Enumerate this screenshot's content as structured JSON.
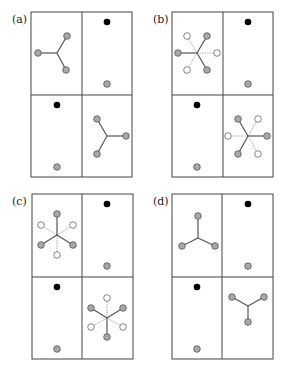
{
  "figure": {
    "panels": [
      {
        "id": "a",
        "label": "(a)",
        "box": {
          "x": 31,
          "y": 12,
          "w": 101,
          "h": 165
        },
        "cells": {
          "top_left": {
            "type": "star3",
            "center": [
              57,
              53
            ],
            "gray": [
              [
                38,
                53
              ],
              [
                67,
                36
              ],
              [
                66,
                70
              ]
            ],
            "white": []
          },
          "top_right": {
            "type": "pair",
            "black": [
              107,
              22
            ],
            "gray": [
              107,
              84
            ]
          },
          "bottom_left": {
            "type": "pair",
            "black": [
              57,
              105
            ],
            "gray": [
              57,
              167
            ]
          },
          "bottom_right": {
            "type": "star3",
            "center": [
              107,
              136
            ],
            "gray": [
              [
                97,
                119
              ],
              [
                126,
                136
              ],
              [
                97,
                154
              ]
            ],
            "white": []
          }
        }
      },
      {
        "id": "b",
        "label": "(b)",
        "box": {
          "x": 172,
          "y": 12,
          "w": 101,
          "h": 165
        },
        "cells": {
          "top_left": {
            "type": "star6",
            "center": [
              197,
              53
            ],
            "gray": [
              [
                178,
                53
              ],
              [
                207,
                36
              ],
              [
                207,
                70
              ]
            ],
            "white": [
              [
                187,
                36
              ],
              [
                217,
                53
              ],
              [
                187,
                70
              ]
            ]
          },
          "top_right": {
            "type": "pair",
            "black": [
              248,
              22
            ],
            "gray": [
              248,
              84
            ]
          },
          "bottom_left": {
            "type": "pair",
            "black": [
              197,
              105
            ],
            "gray": [
              197,
              167
            ]
          },
          "bottom_right": {
            "type": "star6",
            "center": [
              248,
              136
            ],
            "gray": [
              [
                238,
                119
              ],
              [
                267,
                136
              ],
              [
                238,
                154
              ]
            ],
            "white": [
              [
                258,
                119
              ],
              [
                228,
                136
              ],
              [
                258,
                154
              ]
            ]
          }
        }
      },
      {
        "id": "c",
        "label": "(c)",
        "box": {
          "x": 32,
          "y": 194,
          "w": 101,
          "h": 165
        },
        "cells": {
          "top_left": {
            "type": "star6",
            "center": [
              57,
              235
            ],
            "gray": [
              [
                57,
                214
              ],
              [
                41,
                245
              ],
              [
                73,
                245
              ]
            ],
            "white": [
              [
                41,
                225
              ],
              [
                73,
                225
              ],
              [
                57,
                255
              ]
            ]
          },
          "top_right": {
            "type": "pair",
            "black": [
              107,
              204
            ],
            "gray": [
              107,
              266
            ]
          },
          "bottom_left": {
            "type": "pair",
            "black": [
              57,
              287
            ],
            "gray": [
              57,
              349
            ]
          },
          "bottom_right": {
            "type": "star6",
            "center": [
              107,
              318
            ],
            "gray": [
              [
                91,
                308
              ],
              [
                123,
                308
              ],
              [
                107,
                337
              ]
            ],
            "white": [
              [
                107,
                298
              ],
              [
                91,
                327
              ],
              [
                123,
                327
              ]
            ]
          }
        }
      },
      {
        "id": "d",
        "label": "(d)",
        "box": {
          "x": 172,
          "y": 194,
          "w": 101,
          "h": 165
        },
        "cells": {
          "top_left": {
            "type": "star3",
            "center": [
              198,
              238
            ],
            "gray": [
              [
                198,
                216
              ],
              [
                182,
                246
              ],
              [
                215,
                246
              ]
            ],
            "white": []
          },
          "top_right": {
            "type": "pair",
            "black": [
              248,
              204
            ],
            "gray": [
              248,
              266
            ]
          },
          "bottom_left": {
            "type": "pair",
            "black": [
              197,
              287
            ],
            "gray": [
              197,
              349
            ]
          },
          "bottom_right": {
            "type": "star3",
            "center": [
              248,
              306
            ],
            "gray": [
              [
                232,
                297
              ],
              [
                264,
                297
              ],
              [
                248,
                322
              ]
            ],
            "white": []
          }
        }
      }
    ],
    "colors": {
      "gray_node": "#a8a8a8",
      "white_node": "#ffffff",
      "black_node": "#000000",
      "line": "#444444"
    }
  }
}
